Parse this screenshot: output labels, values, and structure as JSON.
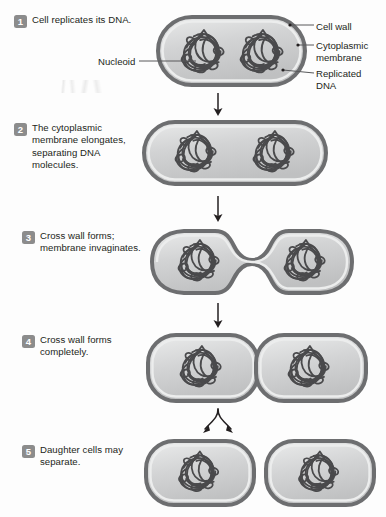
{
  "figure": {
    "steps": [
      {
        "number": "1",
        "text": "Cell replicates its DNA."
      },
      {
        "number": "2",
        "text": "The cytoplasmic membrane elongates, separating DNA molecules."
      },
      {
        "number": "3",
        "text": "Cross wall forms; membrane invaginates."
      },
      {
        "number": "4",
        "text": "Cross wall forms completely."
      },
      {
        "number": "5",
        "text": "Daughter cells may separate."
      }
    ],
    "callouts": {
      "nucleoid": "Nucleoid",
      "cell_wall": "Cell wall",
      "cytoplasmic_membrane": "Cytoplasmic membrane",
      "replicated_dna": "Replicated DNA"
    },
    "colors": {
      "cell_wall": "#6d6e70",
      "cytoplasmic_membrane": "#d8d9da",
      "cytoplasm": "#c9cacb",
      "dna": "#4a4a4c",
      "badge": "#8c8c8c",
      "badge_text": "#ffffff",
      "text": "#231f20",
      "leader_line": "#58595b",
      "arrow": "#231f20",
      "background": "#fdfdfd"
    }
  }
}
